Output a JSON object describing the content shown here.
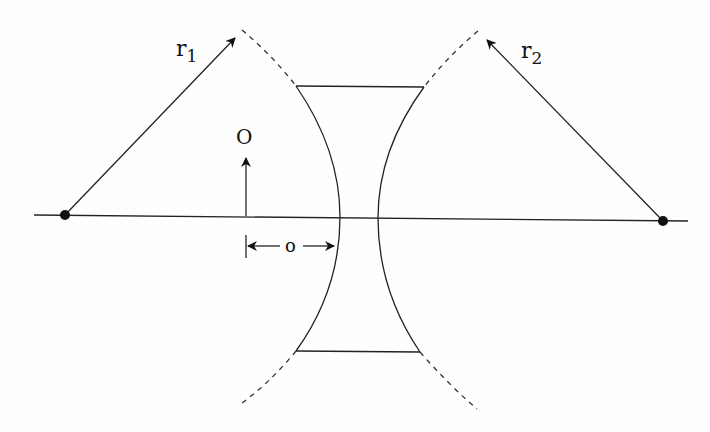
{
  "diagram": {
    "labels": {
      "r1": "r",
      "r1_sub": "1",
      "r2": "r",
      "r2_sub": "2",
      "object": "O",
      "object_distance": "o"
    },
    "colors": {
      "background": "#fefefe",
      "stroke": "#222222"
    }
  }
}
